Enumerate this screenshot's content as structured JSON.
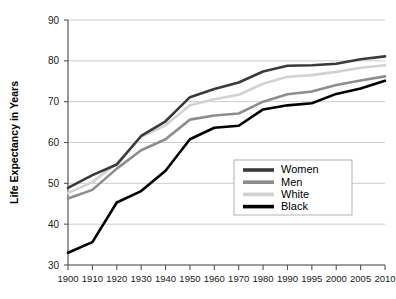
{
  "chart_data": {
    "type": "line",
    "title": "",
    "subtitle": "",
    "xlabel": "",
    "ylabel": "Life Expectancy in Years",
    "categories": [
      "1900",
      "1910",
      "1920",
      "1930",
      "1940",
      "1950",
      "1960",
      "1970",
      "1980",
      "1990",
      "1995",
      "2000",
      "2005",
      "2010"
    ],
    "xlim": [
      0,
      13
    ],
    "ylim": [
      30,
      90
    ],
    "yticks": [
      30,
      40,
      50,
      60,
      70,
      80,
      90
    ],
    "grid": "horizontal",
    "legend_position": "center-right-inside",
    "series": [
      {
        "name": "Women",
        "color": "#3a3a3a",
        "values": [
          48.9,
          52.0,
          54.6,
          61.6,
          65.2,
          71.1,
          73.1,
          74.7,
          77.4,
          78.8,
          78.9,
          79.3,
          80.4,
          81.1
        ]
      },
      {
        "name": "Men",
        "color": "#8d8d8d",
        "values": [
          46.3,
          48.4,
          53.6,
          58.1,
          60.8,
          65.6,
          66.6,
          67.1,
          70.0,
          71.8,
          72.5,
          74.1,
          75.2,
          76.2
        ]
      },
      {
        "name": "White",
        "color": "#d2d2d2",
        "values": [
          47.6,
          50.3,
          54.9,
          61.4,
          64.2,
          69.1,
          70.6,
          71.7,
          74.4,
          76.1,
          76.5,
          77.3,
          78.3,
          78.9
        ]
      },
      {
        "name": "Black",
        "color": "#000000",
        "values": [
          33.0,
          35.6,
          45.3,
          48.1,
          53.1,
          60.8,
          63.6,
          64.1,
          68.1,
          69.1,
          69.6,
          71.9,
          73.2,
          75.1
        ]
      }
    ]
  },
  "legend": {
    "entries": [
      {
        "label": "Women",
        "color": "#3a3a3a"
      },
      {
        "label": "Men",
        "color": "#8d8d8d"
      },
      {
        "label": "White",
        "color": "#d2d2d2"
      },
      {
        "label": "Black",
        "color": "#000000"
      }
    ]
  },
  "axes": {
    "y_title": "Life Expectancy in Years",
    "y_tick_labels": [
      "90",
      "80",
      "70",
      "60",
      "50",
      "40",
      "30"
    ],
    "x_tick_labels": [
      "1900",
      "1910",
      "1920",
      "1930",
      "1940",
      "1950",
      "1960",
      "1970",
      "1980",
      "1990",
      "1995",
      "2000",
      "2005",
      "2010"
    ]
  }
}
